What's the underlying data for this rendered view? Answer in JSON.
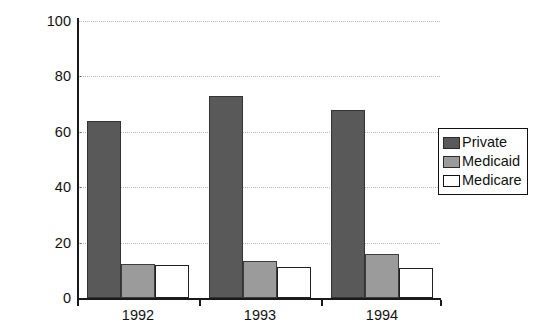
{
  "chart_data": {
    "type": "bar",
    "title": "",
    "xlabel": "",
    "ylabel": "Percent with Coverage",
    "categories": [
      "1992",
      "1993",
      "1994"
    ],
    "series": [
      {
        "name": "Private",
        "values": [
          64,
          73,
          68
        ],
        "color": "#595959"
      },
      {
        "name": "Medicaid",
        "values": [
          12.3,
          13.4,
          16
        ],
        "color": "#9b9b9b"
      },
      {
        "name": "Medicare",
        "values": [
          12,
          11.2,
          10.8
        ],
        "color": "#ffffff"
      }
    ],
    "ylim": [
      0,
      100
    ],
    "yticks": [
      0,
      20,
      40,
      60,
      80,
      100
    ],
    "ytick_labels": [
      "0",
      "20",
      "40",
      "60",
      "80",
      "100"
    ],
    "grid": true,
    "grid_axis": "y",
    "grid_style": "dotted",
    "grid_color": "#b4b4b4",
    "legend_position": "right",
    "legend_entries": [
      "Private",
      "Medicaid",
      "Medicare"
    ],
    "axis_color": "#1a1a1a",
    "background": "#ffffff"
  }
}
